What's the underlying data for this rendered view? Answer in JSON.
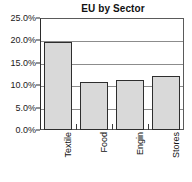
{
  "chart_data": {
    "type": "bar",
    "title": "EU by Sector",
    "xlabel": "",
    "ylabel": "",
    "categories": [
      "Textile",
      "Food",
      "Engin",
      "Stores"
    ],
    "values": [
      19.7,
      10.7,
      11.2,
      12.0
    ],
    "ylim": [
      0,
      25
    ],
    "ytick_values": [
      0,
      5,
      10,
      15,
      20,
      25
    ],
    "ytick_labels": [
      "0.0%",
      "5.0%",
      "10.0%",
      "15.0%",
      "20.0%",
      "25.0%"
    ],
    "grid": true,
    "legend": false,
    "bar_fill_color": "#d9d9d9",
    "bar_border_color": "#2e2e2e",
    "gridline_color": "#8c8c8c",
    "axis_color": "#2b2b2b",
    "text_color": "#111111",
    "xlabel_rotation": 90
  }
}
